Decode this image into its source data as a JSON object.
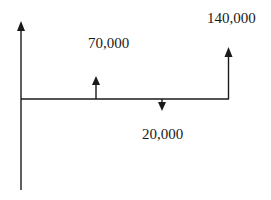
{
  "diagram": {
    "type": "cash-flow-diagram",
    "colors": {
      "line": "#1a1a1a",
      "background": "#ffffff"
    },
    "flows": [
      {
        "id": "inflow-1",
        "direction": "up",
        "label": "70,000",
        "value": 70000
      },
      {
        "id": "outflow-1",
        "direction": "down",
        "label": "20,000",
        "value": -20000
      },
      {
        "id": "inflow-2",
        "direction": "up",
        "label": "140,000",
        "value": 140000
      }
    ]
  }
}
